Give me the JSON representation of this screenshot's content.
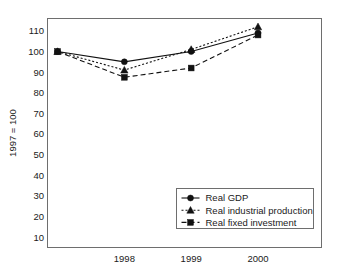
{
  "chart_data": {
    "type": "line",
    "title": "",
    "subtitle": "",
    "xlabel": "",
    "ylabel": "1997 = 100",
    "x": [
      1997,
      1998,
      1999,
      2000
    ],
    "xtick_labels": [
      "1998",
      "1999",
      "2000"
    ],
    "xtick_values": [
      1998,
      1999,
      2000
    ],
    "ytick_labels": [
      "10",
      "20",
      "30",
      "40",
      "50",
      "60",
      "70",
      "80",
      "90",
      "100",
      "110"
    ],
    "ytick_values": [
      10,
      20,
      30,
      40,
      50,
      60,
      70,
      80,
      90,
      100,
      110
    ],
    "ylim": [
      5,
      116
    ],
    "xlim": [
      1996.85,
      2000.95
    ],
    "grid": false,
    "legend_position": "lower-right",
    "series": [
      {
        "name": "Real GDP",
        "marker": "circle",
        "linestyle": "solid",
        "color": "#111111",
        "values": [
          100,
          95,
          100,
          109
        ]
      },
      {
        "name": "Real industrial production",
        "marker": "triangle",
        "linestyle": "dotted",
        "color": "#111111",
        "values": [
          100,
          91,
          101,
          112
        ]
      },
      {
        "name": "Real fixed investment",
        "marker": "square",
        "linestyle": "dashed",
        "color": "#111111",
        "values": [
          100,
          87.5,
          92,
          108
        ]
      }
    ]
  },
  "axes": {
    "y_axis_title": "1997 = 100"
  },
  "legend": {
    "entries": [
      {
        "label": "Real GDP",
        "marker": "circle-marker-icon"
      },
      {
        "label": "Real industrial production",
        "marker": "triangle-marker-icon"
      },
      {
        "label": "Real fixed investment",
        "marker": "square-marker-icon"
      }
    ]
  },
  "colors": {
    "ink": "#111111",
    "frame": "#6e6e6e",
    "background": "#ffffff"
  }
}
